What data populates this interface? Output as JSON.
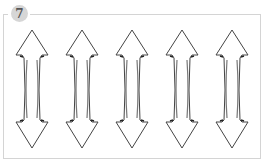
{
  "panel": {
    "number": "7",
    "badge_color": "#d6d6d6",
    "border_color": "#d4d4d4"
  },
  "illustration": {
    "description": "five hand-drawn double-headed vertical arrows",
    "arrow_count": 5,
    "arrows": [
      {
        "name": "arrow-1",
        "center_x": 32
      },
      {
        "name": "arrow-2",
        "center_x": 82
      },
      {
        "name": "arrow-3",
        "center_x": 132
      },
      {
        "name": "arrow-4",
        "center_x": 182
      },
      {
        "name": "arrow-5",
        "center_x": 232
      }
    ],
    "stroke_color": "#444444"
  }
}
